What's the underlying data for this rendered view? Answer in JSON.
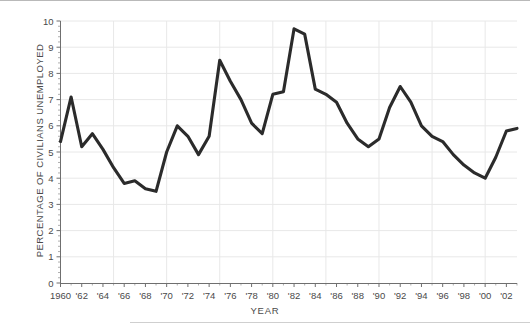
{
  "figure": {
    "background_color": "#ffffff",
    "line_color": "#2b2b2b",
    "grid_color": "#e8e8e8",
    "axis_color": "#6f6f6f",
    "text_color": "#4a4a4a"
  },
  "chart_data": {
    "type": "line",
    "title": "",
    "xlabel": "YEAR",
    "ylabel": "PERCENTAGE OF CIVILIANS UNEMPLOYED",
    "xlim": [
      1960,
      2003
    ],
    "ylim": [
      0,
      10
    ],
    "grid": true,
    "legend": "none",
    "y_ticks": [
      "0",
      "1",
      "2",
      "3",
      "4",
      "5",
      "6",
      "7",
      "8",
      "9",
      "10"
    ],
    "y_tick_values": [
      0,
      1,
      2,
      3,
      4,
      5,
      6,
      7,
      8,
      9,
      10
    ],
    "x_ticks": [
      "1960",
      "'62",
      "'64",
      "'66",
      "'68",
      "'70",
      "'72",
      "'74",
      "'76",
      "'78",
      "'80",
      "'82",
      "'84",
      "'86",
      "'88",
      "'90",
      "'92",
      "'94",
      "'96",
      "'98",
      "'00",
      "'02"
    ],
    "x_tick_values": [
      1960,
      1962,
      1964,
      1966,
      1968,
      1970,
      1972,
      1974,
      1976,
      1978,
      1980,
      1982,
      1984,
      1986,
      1988,
      1990,
      1992,
      1994,
      1996,
      1998,
      2000,
      2002
    ],
    "x": [
      1960,
      1961,
      1962,
      1963,
      1964,
      1965,
      1966,
      1967,
      1968,
      1969,
      1970,
      1971,
      1972,
      1973,
      1974,
      1975,
      1976,
      1977,
      1978,
      1979,
      1980,
      1981,
      1982,
      1983,
      1984,
      1985,
      1986,
      1987,
      1988,
      1989,
      1990,
      1991,
      1992,
      1993,
      1994,
      1995,
      1996,
      1997,
      1998,
      1999,
      2000,
      2001,
      2002,
      2003
    ],
    "values": [
      5.4,
      7.1,
      5.2,
      5.7,
      5.1,
      4.4,
      3.8,
      3.9,
      3.6,
      3.5,
      5.0,
      6.0,
      5.6,
      4.9,
      5.6,
      8.5,
      7.7,
      7.0,
      6.1,
      5.7,
      7.2,
      7.3,
      9.7,
      9.5,
      7.4,
      7.2,
      6.9,
      6.1,
      5.5,
      5.2,
      5.5,
      6.7,
      7.5,
      6.9,
      6.0,
      5.6,
      5.4,
      4.9,
      4.5,
      4.2,
      4.0,
      4.8,
      5.8,
      5.9
    ]
  }
}
